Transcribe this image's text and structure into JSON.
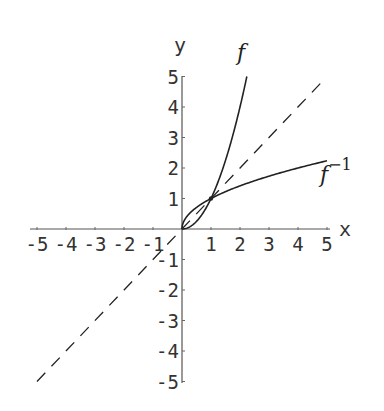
{
  "chart_data": {
    "type": "line",
    "title": "",
    "xlabel": "x",
    "ylabel": "y",
    "xlim": [
      -5,
      5
    ],
    "ylim": [
      -5,
      5
    ],
    "grid": false,
    "legend": "inline labels",
    "x_ticks": [
      -5,
      -4,
      -3,
      -2,
      -1,
      1,
      2,
      3,
      4,
      5
    ],
    "y_ticks": [
      -5,
      -4,
      -3,
      -2,
      -1,
      1,
      2,
      3,
      4,
      5
    ],
    "x_tick_labels": [
      "-5",
      "-4",
      "-3",
      "-2",
      "-1",
      "1",
      "2",
      "3",
      "4",
      "5"
    ],
    "y_tick_labels": [
      "-5",
      "-4",
      "-3",
      "-2",
      "-1",
      "1",
      "2",
      "3",
      "4",
      "5"
    ],
    "series": [
      {
        "name": "f",
        "label": "f",
        "style": "solid",
        "formula": "y = x^2, x >= 0",
        "x": [
          0,
          0.25,
          0.5,
          0.75,
          1,
          1.25,
          1.5,
          1.75,
          2,
          2.236
        ],
        "y": [
          0,
          0.0625,
          0.25,
          0.5625,
          1,
          1.5625,
          2.25,
          3.0625,
          4,
          5
        ]
      },
      {
        "name": "f_inverse",
        "label": "f",
        "label_superscript": "−1",
        "style": "solid",
        "formula": "y = sqrt(x), x >= 0",
        "x": [
          0,
          0.0625,
          0.25,
          0.5625,
          1,
          1.5625,
          2.25,
          3.0625,
          4,
          5
        ],
        "y": [
          0,
          0.25,
          0.5,
          0.75,
          1,
          1.25,
          1.5,
          1.75,
          2,
          2.236
        ]
      },
      {
        "name": "identity",
        "label": "",
        "style": "dashed",
        "formula": "y = x",
        "x": [
          -5,
          4.8
        ],
        "y": [
          -5,
          4.8
        ]
      }
    ],
    "annotations": [
      {
        "type": "point",
        "x": 1,
        "y": 1,
        "note": "intersection of f and f^-1"
      }
    ]
  },
  "labels": {
    "x_axis": "x",
    "y_axis": "y",
    "f": "f",
    "f_inv_base": "f",
    "f_inv_sup": "−1"
  }
}
